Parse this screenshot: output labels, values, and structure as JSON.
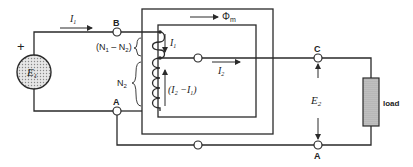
{
  "diagram": {
    "type": "autotransformer-circuit",
    "source": {
      "label": "E",
      "subscript": "1",
      "polarity": "+"
    },
    "currents": {
      "input": {
        "label": "I",
        "subscript": "1"
      },
      "tap_down": {
        "label": "I",
        "subscript": "1"
      },
      "output": {
        "label": "I",
        "subscript": "2"
      },
      "common": {
        "text": "(I",
        "sub1": "2",
        "mid": " −I",
        "sub2": "1",
        "end": ")"
      }
    },
    "flux": {
      "label": "Φ",
      "subscript": "m"
    },
    "windings": {
      "series": {
        "text": "(N",
        "sub1": "1",
        "mid": " – N",
        "sub2": "2",
        "end": ")"
      },
      "common": {
        "label": "N",
        "subscript": "2"
      }
    },
    "nodes": {
      "B": "B",
      "A_left": "A",
      "C": "C",
      "A_right": "A"
    },
    "output_voltage": {
      "label": "E",
      "subscript": "2"
    },
    "load": {
      "label": "load"
    },
    "colors": {
      "line": "#2a2a2a",
      "source_fill": "#d8d8d8",
      "load_fill": "#bdbdbd"
    }
  }
}
